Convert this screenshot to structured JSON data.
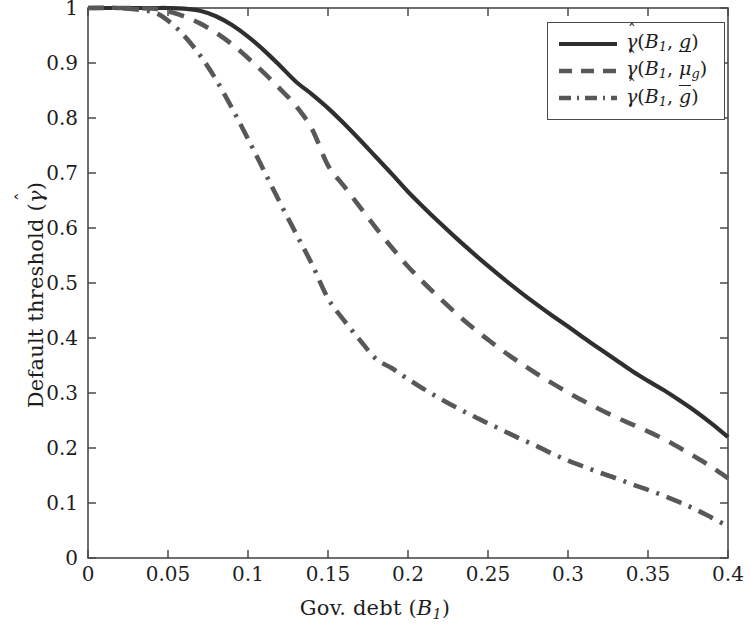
{
  "chart_data": {
    "type": "line",
    "title": "",
    "xlabel": "Gov. debt (B_1)",
    "ylabel": "Default threshold (gamma-hat)",
    "xlim": [
      0,
      0.4
    ],
    "ylim": [
      0,
      1
    ],
    "grid": false,
    "legend_position": "top-right",
    "xticks": [
      "0",
      "0.05",
      "0.1",
      "0.15",
      "0.2",
      "0.25",
      "0.3",
      "0.35",
      "0.4"
    ],
    "xtick_values": [
      0,
      0.05,
      0.1,
      0.15,
      0.2,
      0.25,
      0.3,
      0.35,
      0.4
    ],
    "yticks": [
      "0",
      "0.1",
      "0.2",
      "0.3",
      "0.4",
      "0.5",
      "0.6",
      "0.7",
      "0.8",
      "0.9",
      "1"
    ],
    "ytick_values": [
      0,
      0.1,
      0.2,
      0.3,
      0.4,
      0.5,
      0.6,
      0.7,
      0.8,
      0.9,
      1
    ],
    "x": [
      0,
      0.02,
      0.04,
      0.05,
      0.06,
      0.07,
      0.08,
      0.09,
      0.1,
      0.11,
      0.12,
      0.13,
      0.14,
      0.15,
      0.16,
      0.17,
      0.18,
      0.19,
      0.2,
      0.21,
      0.22,
      0.23,
      0.24,
      0.25,
      0.26,
      0.27,
      0.28,
      0.29,
      0.3,
      0.31,
      0.32,
      0.33,
      0.34,
      0.35,
      0.36,
      0.37,
      0.38,
      0.39,
      0.4
    ],
    "series": [
      {
        "name": "gamma-hat(B_1, g-under)",
        "style": "solid",
        "color": "#2f2f2f",
        "values": [
          1,
          1,
          1,
          1,
          0.999,
          0.995,
          0.985,
          0.969,
          0.948,
          0.923,
          0.895,
          0.866,
          0.843,
          0.818,
          0.79,
          0.76,
          0.729,
          0.698,
          0.666,
          0.637,
          0.609,
          0.582,
          0.556,
          0.531,
          0.507,
          0.484,
          0.462,
          0.441,
          0.421,
          0.4,
          0.38,
          0.36,
          0.34,
          0.322,
          0.305,
          0.286,
          0.266,
          0.244,
          0.22
        ]
      },
      {
        "name": "gamma-hat(B_1, mu_g)",
        "style": "dashed",
        "color": "#585858",
        "values": [
          1,
          1,
          0.999,
          0.994,
          0.985,
          0.972,
          0.955,
          0.934,
          0.909,
          0.882,
          0.853,
          0.822,
          0.78,
          0.714,
          0.676,
          0.638,
          0.6,
          0.564,
          0.53,
          0.5,
          0.472,
          0.445,
          0.42,
          0.397,
          0.375,
          0.355,
          0.336,
          0.318,
          0.301,
          0.285,
          0.27,
          0.256,
          0.243,
          0.23,
          0.216,
          0.2,
          0.183,
          0.165,
          0.145
        ]
      },
      {
        "name": "gamma-hat(B_1, g-over)",
        "style": "dashdot",
        "color": "#585858",
        "values": [
          1,
          1,
          0.993,
          0.977,
          0.95,
          0.914,
          0.87,
          0.818,
          0.762,
          0.704,
          0.646,
          0.59,
          0.534,
          0.472,
          0.432,
          0.396,
          0.362,
          0.345,
          0.325,
          0.307,
          0.29,
          0.274,
          0.259,
          0.245,
          0.231,
          0.217,
          0.204,
          0.19,
          0.177,
          0.166,
          0.155,
          0.145,
          0.134,
          0.124,
          0.113,
          0.101,
          0.088,
          0.073,
          0.058
        ]
      }
    ]
  },
  "legend": {
    "entries": [
      {
        "gamma": "γ",
        "hat": "ˆ",
        "open": "(",
        "base": "B",
        "sub": "1",
        "comma": ",",
        "arg": "g",
        "decoration": "underline",
        "arg_sub": "",
        "close": ")"
      },
      {
        "gamma": "γ",
        "hat": "ˆ",
        "open": "(",
        "base": "B",
        "sub": "1",
        "comma": ",",
        "arg": "μ",
        "decoration": "none",
        "arg_sub": "g",
        "close": ")"
      },
      {
        "gamma": "γ",
        "hat": "ˆ",
        "open": "(",
        "base": "B",
        "sub": "1",
        "comma": ",",
        "arg": "g",
        "decoration": "overline",
        "arg_sub": "",
        "close": ")"
      }
    ]
  },
  "axes": {
    "x_title": {
      "text": "Gov. debt",
      "open": "(",
      "var": "B",
      "sub": "1",
      "close": ")"
    },
    "y_title": {
      "text": "Default threshold",
      "open": "(",
      "gamma": "γ",
      "hat": "ˆ",
      "close": ")"
    }
  },
  "colors": {
    "axis": "#4a4a4a",
    "solid_line": "#2f2f2f",
    "dashed_line": "#585858",
    "dashdot_line": "#585858",
    "background": "#ffffff"
  }
}
